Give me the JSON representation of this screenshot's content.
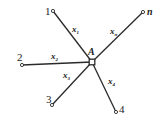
{
  "diagram": {
    "type": "star-network",
    "colors": {
      "line": "#2a2a2a",
      "text": "#222222",
      "background": "#ffffff"
    },
    "center": {
      "id": "A",
      "label": "A",
      "x": 92,
      "y": 62
    },
    "nodes": [
      {
        "id": "1",
        "label": "1",
        "x": 53,
        "y": 11,
        "label_x": 45,
        "label_y": 15
      },
      {
        "id": "n",
        "label": "n",
        "x": 143,
        "y": 12,
        "label_x": 147,
        "label_y": 15
      },
      {
        "id": "2",
        "label": "2",
        "x": 22,
        "y": 65,
        "label_x": 17,
        "label_y": 61
      },
      {
        "id": "3",
        "label": "3",
        "x": 52,
        "y": 105,
        "label_x": 46,
        "label_y": 103
      },
      {
        "id": "4",
        "label": "4",
        "x": 116,
        "y": 112,
        "label_x": 119,
        "label_y": 113
      }
    ],
    "edges": [
      {
        "from": "1",
        "to": "A",
        "var": "x",
        "sub": "1",
        "label_x": 72,
        "label_y": 32
      },
      {
        "from": "n",
        "to": "A",
        "var": "x",
        "sub": "n",
        "label_x": 110,
        "label_y": 34
      },
      {
        "from": "2",
        "to": "A",
        "var": "x",
        "sub": "2",
        "label_x": 51,
        "label_y": 59
      },
      {
        "from": "3",
        "to": "A",
        "var": "x",
        "sub": "3",
        "label_x": 63,
        "label_y": 78
      },
      {
        "from": "4",
        "to": "A",
        "var": "x",
        "sub": "4",
        "label_x": 108,
        "label_y": 84
      }
    ],
    "center_label": {
      "text": "A",
      "x": 88,
      "y": 55
    }
  }
}
